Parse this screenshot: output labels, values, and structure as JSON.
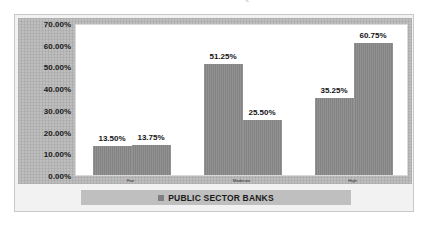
{
  "chart_data": {
    "type": "bar",
    "title": "PERCEPTION OF CUSTOMERS TOWARDS SERVICE QUALITY OF PUBLIC SECTOR BANKS",
    "xlabel": "",
    "ylabel": "",
    "ylim": [
      0,
      70
    ],
    "ytick_labels": [
      "0.00%",
      "10.00%",
      "20.00%",
      "30.00%",
      "40.00%",
      "50.00%",
      "60.00%",
      "70.00%"
    ],
    "ytick_values": [
      0,
      10,
      20,
      30,
      40,
      50,
      60,
      70
    ],
    "grid": false,
    "legend_position": "bottom",
    "categories": [
      "Fair",
      "Moderate",
      "High"
    ],
    "series": [
      {
        "name": "PUBLIC SECTOR BANKS",
        "color": "#8a8a8a",
        "values": [
          13.5,
          51.25,
          35.25
        ],
        "labels": [
          "13.50%",
          "51.25%",
          "35.25%"
        ]
      },
      {
        "name": "PUBLIC SECTOR BANKS",
        "color": "#8a8a8a",
        "values": [
          13.75,
          25.5,
          60.75
        ],
        "labels": [
          "13.75%",
          "25.50%",
          "60.75%"
        ]
      }
    ],
    "legend": [
      {
        "label": "PUBLIC SECTOR BANKS",
        "color": "#8a8a8a",
        "marker": "square-marker"
      }
    ]
  },
  "axis": {
    "ticks": [
      {
        "label": "70.00%",
        "value": 70
      },
      {
        "label": "60.00%",
        "value": 60
      },
      {
        "label": "50.00%",
        "value": 50
      },
      {
        "label": "40.00%",
        "value": 40
      },
      {
        "label": "30.00%",
        "value": 30
      },
      {
        "label": "20.00%",
        "value": 20
      },
      {
        "label": "10.00%",
        "value": 10
      },
      {
        "label": "0.00%",
        "value": 0
      }
    ],
    "categories": [
      {
        "label": "Fair"
      },
      {
        "label": "Moderate"
      },
      {
        "label": "High"
      }
    ]
  },
  "bars": [
    {
      "label": "13.50%",
      "value": 13.5
    },
    {
      "label": "13.75%",
      "value": 13.75
    },
    {
      "label": "51.25%",
      "value": 51.25
    },
    {
      "label": "25.50%",
      "value": 25.5
    },
    {
      "label": "35.25%",
      "value": 35.25
    },
    {
      "label": "60.75%",
      "value": 60.75
    }
  ],
  "legend": {
    "label": "PUBLIC SECTOR BANKS"
  }
}
